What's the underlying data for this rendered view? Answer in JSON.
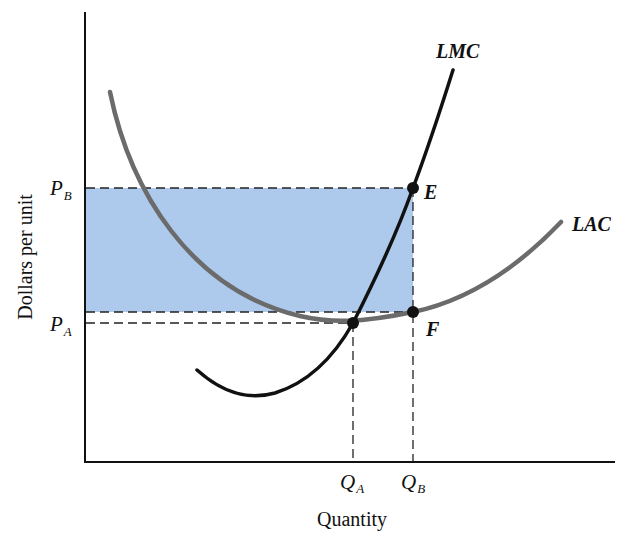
{
  "diagram": {
    "type": "economics-cost-curves",
    "y_axis_label": "Dollars per unit",
    "x_axis_label": "Quantity",
    "price_levels": [
      {
        "symbol": "P",
        "subscript": "B",
        "description": "price at quantity Q_B (where LMC meets E)"
      },
      {
        "symbol": "P",
        "subscript": "A",
        "description": "minimum of LAC at quantity Q_A"
      }
    ],
    "quantity_levels": [
      {
        "symbol": "Q",
        "subscript": "A"
      },
      {
        "symbol": "Q",
        "subscript": "B"
      }
    ],
    "curves": [
      {
        "name": "LMC",
        "label": "LMC",
        "color": "#111111",
        "description": "long-run marginal cost, U-shaped, crosses LAC at its minimum"
      },
      {
        "name": "LAC",
        "label": "LAC",
        "color": "#6b6b6b",
        "description": "long-run average cost, U-shaped"
      }
    ],
    "points": [
      {
        "label": "E",
        "on": "LMC",
        "at": "Q_B, P_B"
      },
      {
        "label": "F",
        "on": "LAC",
        "at": "Q_B"
      },
      {
        "label": "",
        "on": "LMC & LAC intersection",
        "at": "Q_A, P_A"
      }
    ],
    "shaded_region": {
      "description": "rectangle between P_B and LAC level at F, from axis to Q_B (profit area)",
      "color": "#a9c6ea"
    },
    "colors": {
      "axis": "#111111",
      "lmc": "#111111",
      "lac": "#6b6b6b",
      "shade": "#a9c6ea",
      "dash": "#222222"
    }
  }
}
